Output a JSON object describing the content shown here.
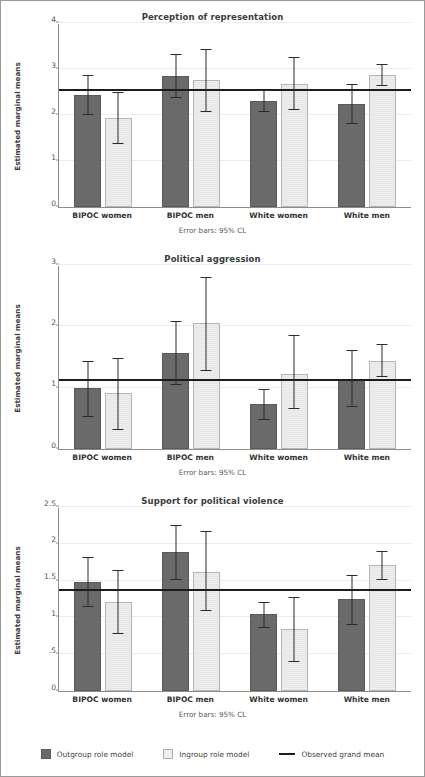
{
  "figure": {
    "error_note": "Error bars: 95% CL",
    "ylabel": "Estimated marginal means",
    "categories": [
      "BIPOC women",
      "BIPOC men",
      "White women",
      "White men"
    ]
  },
  "legend": {
    "items": [
      {
        "label": "Outgroup role model",
        "marker": "filled-square-dark",
        "color": "#6a6a6a"
      },
      {
        "label": "Ingroup role model",
        "marker": "filled-square-light",
        "color": "#eeeeee"
      },
      {
        "label": "Observed grand mean",
        "marker": "horizontal-line",
        "color": "#1c1c1c"
      }
    ]
  },
  "chart_data": [
    {
      "type": "bar",
      "title": "Perception of representation",
      "xlabel": "",
      "ylabel": "Estimated marginal means",
      "ylim": [
        0,
        4
      ],
      "yticks": [
        0,
        1,
        2,
        3,
        4
      ],
      "ytick_labels": [
        "0",
        "1",
        "2",
        "3",
        "4"
      ],
      "grid": true,
      "legend_position": "bottom",
      "categories": [
        "BIPOC women",
        "BIPOC men",
        "White women",
        "White men"
      ],
      "grand_mean": 2.52,
      "grand_mean_label": "Observed grand mean",
      "error_bars": "95% CL",
      "series": [
        {
          "name": "Outgroup role model",
          "values": [
            2.43,
            2.85,
            2.31,
            2.25
          ],
          "ci_lower": [
            1.99,
            2.38,
            2.07,
            1.81
          ],
          "ci_upper": [
            2.86,
            3.32,
            2.54,
            2.68
          ]
        },
        {
          "name": "Ingroup role model",
          "values": [
            1.93,
            2.76,
            2.68,
            2.87
          ],
          "ci_lower": [
            1.36,
            2.07,
            2.1,
            2.63
          ],
          "ci_upper": [
            2.5,
            3.44,
            3.26,
            3.11
          ]
        }
      ]
    },
    {
      "type": "bar",
      "title": "Political aggression",
      "xlabel": "",
      "ylabel": "Estimated marginal means",
      "ylim": [
        0,
        3
      ],
      "yticks": [
        0,
        1,
        2,
        3
      ],
      "ytick_labels": [
        "0",
        "1",
        "2",
        "3"
      ],
      "grid": true,
      "legend_position": "bottom",
      "categories": [
        "BIPOC women",
        "BIPOC men",
        "White women",
        "White men"
      ],
      "grand_mean": 1.11,
      "grand_mean_label": "Observed grand mean",
      "error_bars": "95% CL",
      "series": [
        {
          "name": "Outgroup role model",
          "values": [
            0.99,
            1.56,
            0.73,
            1.14
          ],
          "ci_lower": [
            0.53,
            1.05,
            0.48,
            0.68
          ],
          "ci_upper": [
            1.43,
            2.08,
            0.98,
            1.61
          ]
        },
        {
          "name": "Ingroup role model",
          "values": [
            0.91,
            2.05,
            1.22,
            1.44
          ],
          "ci_lower": [
            0.31,
            1.27,
            0.65,
            1.18
          ],
          "ci_upper": [
            1.48,
            2.81,
            1.86,
            1.72
          ]
        }
      ]
    },
    {
      "type": "bar",
      "title": "Support for political violence",
      "xlabel": "",
      "ylabel": "Estimated marginal means",
      "ylim": [
        0,
        2.5
      ],
      "yticks": [
        0,
        0.5,
        1,
        1.5,
        2,
        2.5
      ],
      "ytick_labels": [
        "0",
        ".5",
        "1",
        "1.5",
        "2",
        "2.5"
      ],
      "grid": true,
      "legend_position": "bottom",
      "categories": [
        "BIPOC women",
        "BIPOC men",
        "White women",
        "White men"
      ],
      "grand_mean": 1.36,
      "grand_mean_label": "Observed grand mean",
      "error_bars": "95% CL",
      "series": [
        {
          "name": "Outgroup role model",
          "values": [
            1.48,
            1.89,
            1.04,
            1.25
          ],
          "ci_lower": [
            1.14,
            1.51,
            0.86,
            0.9
          ],
          "ci_upper": [
            1.82,
            2.26,
            1.21,
            1.58
          ]
        },
        {
          "name": "Ingroup role model",
          "values": [
            1.21,
            1.62,
            0.84,
            1.71
          ],
          "ci_lower": [
            0.77,
            1.09,
            0.39,
            1.51
          ],
          "ci_upper": [
            1.64,
            2.18,
            1.28,
            1.9
          ]
        }
      ]
    }
  ]
}
